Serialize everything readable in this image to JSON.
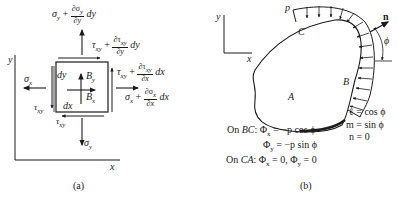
{
  "figure_a": {
    "caption": "(a)",
    "axis_x": "x",
    "axis_y": "y",
    "top_stress": {
      "base": "σ",
      "sub": "y",
      "plus": "+",
      "num": "∂σ",
      "num_sub": "y",
      "den": "∂y",
      "tail": "dy"
    },
    "top_shear": {
      "base": "τ",
      "sub": "xy",
      "plus": "+",
      "num": "∂τ",
      "num_sub": "xy",
      "den": "∂y",
      "tail": "dy"
    },
    "right_shear": {
      "base": "τ",
      "sub": "xy",
      "plus": "+",
      "num": "∂τ",
      "num_sub": "xy",
      "den": "∂x",
      "tail": "dx"
    },
    "right_stress": {
      "base": "σ",
      "sub": "x",
      "plus": "+",
      "num": "∂σ",
      "num_sub": "x",
      "den": "∂x",
      "tail": "dx"
    },
    "left_stress": {
      "base": "σ",
      "sub": "x"
    },
    "left_shear": {
      "base": "τ",
      "sub": "xy"
    },
    "bottom_shear": {
      "base": "τ",
      "sub": "xy"
    },
    "bottom_stress": {
      "base": "σ",
      "sub": "y"
    },
    "body_force_y": {
      "base": "B",
      "sub": "y"
    },
    "body_force_x": {
      "base": "B",
      "sub": "x"
    },
    "dy_label": "dy",
    "dx_label": "dx"
  },
  "figure_b": {
    "caption": "(b)",
    "axis_x": "x",
    "axis_y": "y",
    "load_label": "p",
    "normal_label": "n",
    "angle_label": "ϕ",
    "point_A": "A",
    "point_B": "B",
    "point_C": "C",
    "direction_cosines": [
      "ℓ = cos ϕ",
      "m = sin ϕ",
      "n = 0"
    ],
    "conditions": [
      {
        "prefix": "On ",
        "seg": "BC",
        "text": ": Φ",
        "sub": "x",
        "rest": " = −p cos ϕ"
      },
      {
        "prefix": "",
        "seg": "",
        "text": "Φ",
        "sub": "y",
        "rest": " = −p sin ϕ"
      },
      {
        "prefix": "On ",
        "seg": "CA",
        "text": ": Φ",
        "sub": "x",
        "rest": " = 0, Φ",
        "sub2": "y",
        "rest2": " = 0"
      }
    ]
  }
}
